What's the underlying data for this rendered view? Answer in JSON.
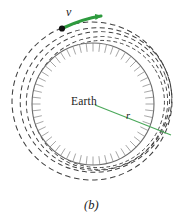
{
  "figure": {
    "panel_label": "(b)",
    "center_label": "Earth",
    "velocity_label": "v",
    "radius_label": "r",
    "colors": {
      "orbit_dashed": "#3f3f3f",
      "earth_outline": "#6b6b6b",
      "earth_hatch": "#8a8a8a",
      "velocity_arrow": "#2e9b3e",
      "radius_line": "#4aa85a",
      "launch_point": "#111111",
      "background": "#ffffff",
      "text": "#1b1b1b"
    },
    "geometry": {
      "earth_center_x": 93,
      "earth_center_y": 104,
      "earth_radius": 61,
      "launch_point_x": 62,
      "launch_point_y": 28,
      "radius_end_x": 160,
      "radius_end_y": 130,
      "radius_start_x": 95,
      "radius_start_y": 105
    },
    "elements": {
      "earth_body_name": "earth-hatched-circle",
      "orbit_count": 5
    }
  },
  "chart_data": {
    "type": "scatter",
    "title": "(b)",
    "xlabel": "",
    "ylabel": "",
    "annotations": [
      "Earth",
      "v",
      "r"
    ],
    "series": [
      {
        "name": "orbit-1",
        "description": "innermost dashed trajectory from launch point",
        "semi_major": 64,
        "semi_minor": 62
      },
      {
        "name": "orbit-2",
        "description": "second dashed trajectory",
        "semi_major": 68,
        "semi_minor": 64
      },
      {
        "name": "orbit-3",
        "description": "third dashed trajectory",
        "semi_major": 72,
        "semi_minor": 66
      },
      {
        "name": "orbit-4",
        "description": "fourth dashed trajectory",
        "semi_major": 76,
        "semi_minor": 68
      },
      {
        "name": "orbit-5",
        "description": "outermost dashed circular orbit",
        "semi_major": 80,
        "semi_minor": 78
      }
    ]
  }
}
